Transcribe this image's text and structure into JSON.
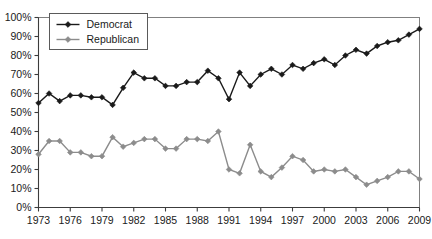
{
  "chart_data": {
    "type": "line",
    "title": "",
    "subtitle": "",
    "xlabel": "",
    "ylabel": "",
    "xlim": [
      1973,
      2009
    ],
    "ylim": [
      0,
      100
    ],
    "grid": false,
    "legend_position": "top-left",
    "y_tick_labels": [
      "0%",
      "10%",
      "20%",
      "30%",
      "40%",
      "50%",
      "60%",
      "70%",
      "80%",
      "90%",
      "100%"
    ],
    "y_ticks": [
      0,
      10,
      20,
      30,
      40,
      50,
      60,
      70,
      80,
      90,
      100
    ],
    "x_tick_labels": [
      "1973",
      "1976",
      "1979",
      "1982",
      "1985",
      "1988",
      "1991",
      "1994",
      "1997",
      "2000",
      "2003",
      "2006",
      "2009"
    ],
    "x_ticks": [
      1973,
      1976,
      1979,
      1982,
      1985,
      1988,
      1991,
      1994,
      1997,
      2000,
      2003,
      2006,
      2009
    ],
    "x": [
      1973,
      1974,
      1975,
      1976,
      1977,
      1978,
      1979,
      1980,
      1981,
      1982,
      1983,
      1984,
      1985,
      1986,
      1987,
      1988,
      1989,
      1990,
      1991,
      1992,
      1993,
      1994,
      1995,
      1996,
      1997,
      1998,
      1999,
      2000,
      2001,
      2002,
      2003,
      2004,
      2005,
      2006,
      2007,
      2008,
      2009
    ],
    "series": [
      {
        "name": "Democrat",
        "color": "#1a1a1a",
        "marker": "diamond",
        "values": [
          55,
          60,
          56,
          59,
          59,
          58,
          58,
          54,
          63,
          71,
          68,
          68,
          64,
          64,
          66,
          66,
          72,
          68,
          57,
          71,
          64,
          70,
          73,
          70,
          75,
          73,
          76,
          78,
          75,
          80,
          83,
          81,
          85,
          87,
          88,
          91,
          94
        ]
      },
      {
        "name": "Republican",
        "color": "#8c8c8c",
        "marker": "diamond",
        "values": [
          28,
          35,
          35,
          29,
          29,
          27,
          27,
          37,
          32,
          34,
          36,
          36,
          31,
          31,
          36,
          36,
          35,
          40,
          20,
          18,
          33,
          19,
          16,
          21,
          27,
          25,
          19,
          20,
          19,
          20,
          16,
          12,
          14,
          16,
          19,
          19,
          15
        ]
      }
    ]
  },
  "legend": {
    "items": [
      {
        "label": "Democrat",
        "color": "#1a1a1a"
      },
      {
        "label": "Republican",
        "color": "#8c8c8c"
      }
    ]
  }
}
